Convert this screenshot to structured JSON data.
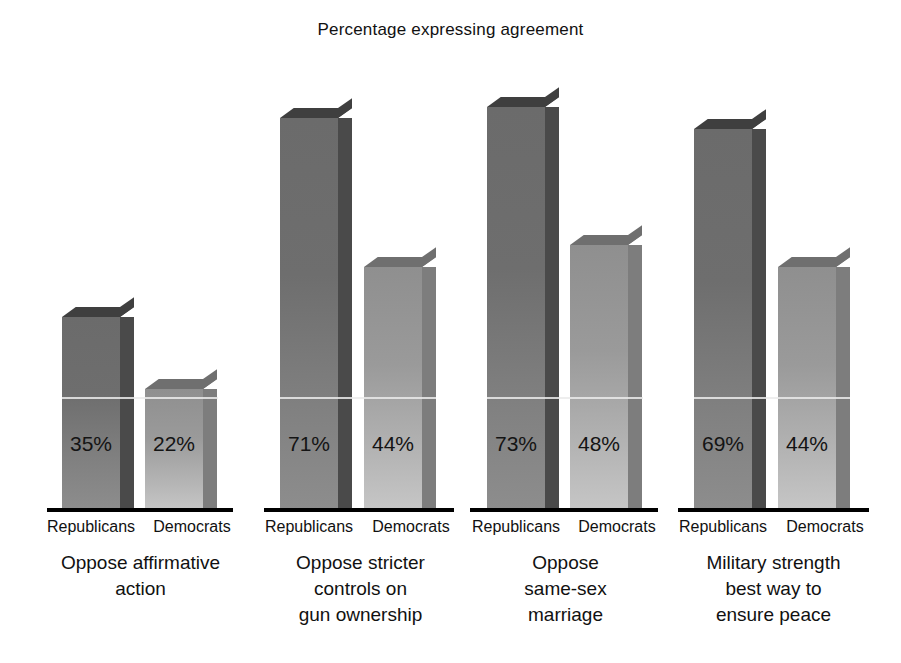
{
  "chart_data": {
    "type": "bar",
    "title": "Percentage expressing agreement",
    "xlabel": "",
    "ylabel": "",
    "ylim": [
      0,
      100
    ],
    "grid": false,
    "legend": "none",
    "value_suffix": "%",
    "categories": [
      "Oppose affirmative action",
      "Oppose stricter controls on gun ownership",
      "Oppose same-sex marriage",
      "Military strength best way to ensure peace"
    ],
    "category_lines": [
      [
        "Oppose affirmative",
        "action"
      ],
      [
        "Oppose stricter",
        "controls on",
        "gun ownership"
      ],
      [
        "Oppose",
        "same-sex",
        "marriage"
      ],
      [
        "Military strength",
        "best way to",
        "ensure peace"
      ]
    ],
    "series": [
      {
        "name": "Republicans",
        "values": [
          35,
          71,
          73,
          69
        ],
        "color": "#6e6e6e"
      },
      {
        "name": "Democrats",
        "values": [
          22,
          44,
          48,
          44
        ],
        "color": "#a8a8a8"
      }
    ],
    "groups": [
      {
        "caption_lines": [
          "Oppose affirmative",
          "action"
        ],
        "bars": [
          {
            "party": "Republicans",
            "value": 35,
            "label": "35%"
          },
          {
            "party": "Democrats",
            "value": 22,
            "label": "22%"
          }
        ]
      },
      {
        "caption_lines": [
          "Oppose stricter",
          "controls on",
          "gun ownership"
        ],
        "bars": [
          {
            "party": "Republicans",
            "value": 71,
            "label": "71%"
          },
          {
            "party": "Democrats",
            "value": 44,
            "label": "44%"
          }
        ]
      },
      {
        "caption_lines": [
          "Oppose",
          "same-sex",
          "marriage"
        ],
        "bars": [
          {
            "party": "Republicans",
            "value": 73,
            "label": "73%"
          },
          {
            "party": "Democrats",
            "value": 48,
            "label": "48%"
          }
        ]
      },
      {
        "caption_lines": [
          "Military strength",
          "best way to",
          "ensure peace"
        ],
        "bars": [
          {
            "party": "Republicans",
            "value": 69,
            "label": "69%"
          },
          {
            "party": "Democrats",
            "value": 44,
            "label": "44%"
          }
        ]
      }
    ]
  },
  "labels": {
    "group1": {
      "republicans": "Republicans",
      "democrats": "Democrats",
      "value_rep": "35%",
      "value_dem": "22%",
      "caption_l1": "Oppose affirmative",
      "caption_l2": "action",
      "caption_l3": ""
    },
    "group2": {
      "republicans": "Republicans",
      "democrats": "Democrats",
      "value_rep": "71%",
      "value_dem": "44%",
      "caption_l1": "Oppose stricter",
      "caption_l2": "controls on",
      "caption_l3": "gun ownership"
    },
    "group3": {
      "republicans": "Republicans",
      "democrats": "Democrats",
      "value_rep": "73%",
      "value_dem": "48%",
      "caption_l1": "Oppose",
      "caption_l2": "same-sex",
      "caption_l3": "marriage"
    },
    "group4": {
      "republicans": "Republicans",
      "democrats": "Democrats",
      "value_rep": "69%",
      "value_dem": "44%",
      "caption_l1": "Military strength",
      "caption_l2": "best way to",
      "caption_l3": "ensure peace"
    }
  },
  "colors": {
    "republican_bar": "#6e6e6e",
    "democrat_bar": "#a8a8a8",
    "republican_side": "#4a4a4a",
    "democrat_side": "#7d7d7d",
    "axis": "#000000",
    "text": "#111111",
    "background": "#ffffff"
  }
}
